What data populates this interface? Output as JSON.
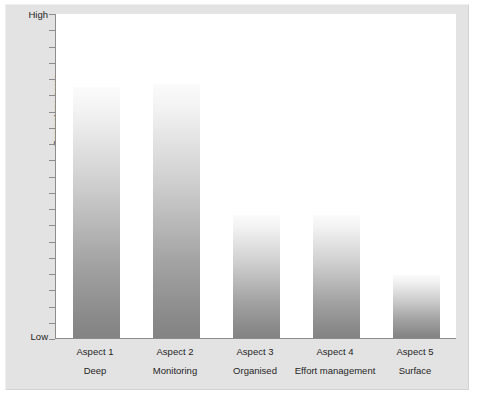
{
  "chart_data": {
    "type": "bar",
    "title": "",
    "subtitle": "",
    "xlabel": "",
    "ylabel": "Percentage score",
    "ylim": [
      0,
      100
    ],
    "y_axis_min_label": "Low",
    "y_axis_max_label": "High",
    "grid": false,
    "legend": null,
    "tick_count": 21,
    "categories": [
      "Aspect 1",
      "Aspect 2",
      "Aspect 3",
      "Aspect 4",
      "Aspect 5"
    ],
    "category_descriptions": [
      "Deep",
      "Monitoring",
      "Organised",
      "Effort management",
      "Surface"
    ],
    "values": [
      77.5,
      78.5,
      38,
      38,
      19.5
    ],
    "bar_fill": "vertical gradient white-to-grey",
    "bar_color_top": "#fbfbfb",
    "bar_color_bottom": "#838383"
  },
  "figure": {
    "background_color": "#e3e3e3",
    "plot_background_color": "#ffffff",
    "axis_color": "#8c8c8c"
  },
  "axis": {
    "y_title": "Percentage score",
    "high_label": "High",
    "low_label": "Low"
  },
  "bars": [
    {
      "category": "Aspect 1",
      "description": "Deep",
      "value": 77.5
    },
    {
      "category": "Aspect 2",
      "description": "Monitoring",
      "value": 78.5
    },
    {
      "category": "Aspect 3",
      "description": "Organised",
      "value": 38
    },
    {
      "category": "Aspect 4",
      "description": "Effort management",
      "value": 38
    },
    {
      "category": "Aspect 5",
      "description": "Surface",
      "value": 19.5
    }
  ]
}
